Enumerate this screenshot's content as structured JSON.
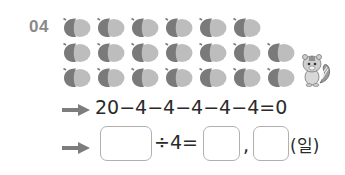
{
  "problem": {
    "number": "04",
    "acorn_rows": [
      6,
      7,
      7
    ],
    "acorn_colors": {
      "dark": "#7a7a7a",
      "light": "#bdbdbd"
    },
    "mascot": "chipmunk-icon"
  },
  "line1": {
    "arrow": "arrow-right-icon",
    "expression": "20−4−4−4−4−4=0"
  },
  "line2": {
    "arrow": "arrow-right-icon",
    "divide_text": "÷4=",
    "comma": ",",
    "unit": "(일)",
    "answer_boxes": [
      "",
      "",
      ""
    ]
  }
}
